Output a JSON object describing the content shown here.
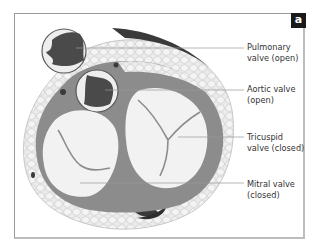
{
  "figure": {
    "panel_badge": "a",
    "labels": [
      {
        "line1": "Pulmonary",
        "line2": "valve (open)"
      },
      {
        "line1": "Aortic valve",
        "line2": "(open)"
      },
      {
        "line1": "Tricuspid",
        "line2": "valve (closed)"
      },
      {
        "line1": "Mitral valve",
        "line2": "(closed)"
      }
    ],
    "colors": {
      "fat": "#e6e6e6",
      "fat_outline": "#bdbdbd",
      "muscle": "#8c8c8c",
      "valve_leaflet": "#eeeeee",
      "open_orifice": "#4a4a4a",
      "dark_tissue": "#3a3a3a",
      "leader_line": "#9a9a9a"
    }
  }
}
